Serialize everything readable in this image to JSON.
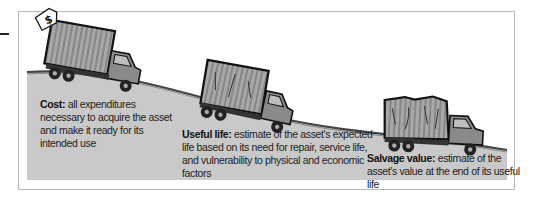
{
  "figure": {
    "stages": [
      {
        "term": "Cost:",
        "description": "all expenditures necessary to acquire the asset and make it ready for its intended use",
        "lines": [
          "all expenditures",
          "necessary to acquire the",
          "asset and make it ready for",
          "its intended use"
        ],
        "truck_condition": "new",
        "icon": "price-tag-dollar-icon"
      },
      {
        "term": "Useful life:",
        "description": "estimate of the asset's expected life based on its need for repair, service life, and vulnerability to physical and economic factors",
        "lines": [
          "estimate of the",
          "asset's expected life based on its need",
          "for repair, service life, and vulnerability",
          "to physical and economic factors"
        ],
        "truck_condition": "worn"
      },
      {
        "term": "Salvage value:",
        "description": "estimate of the asset's value at the end of its useful life",
        "lines": [
          "estimate of the asset's",
          "value at the end of its useful life"
        ],
        "truck_condition": "old"
      }
    ],
    "price_tag_symbol": "$",
    "colors": {
      "ground": "#c9c9c9",
      "ridge": "#555555",
      "truck_body": "#8a8a8a",
      "truck_cargo": "#9e9e9e",
      "outline": "#111111",
      "frame": "#b9b9b9"
    }
  }
}
